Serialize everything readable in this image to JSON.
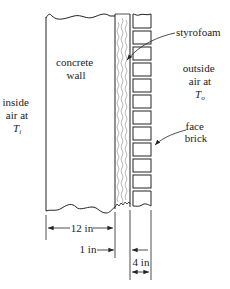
{
  "labels": {
    "concrete_wall": [
      "concrete",
      "wall"
    ],
    "inside_air": [
      "inside",
      "air at"
    ],
    "inside_temp": {
      "symbol": "T",
      "sub": "i"
    },
    "outside_air": [
      "outside",
      "air at"
    ],
    "outside_temp": {
      "symbol": "T",
      "sub": "o"
    },
    "styrofoam": "styrofoam",
    "face_brick": [
      "face",
      "brick"
    ]
  },
  "dimensions": {
    "concrete": "12 in",
    "styrofoam": "1 in",
    "brick": "4 in"
  },
  "colors": {
    "line": "#222222",
    "background": "#ffffff"
  },
  "layers": [
    {
      "name": "concrete wall",
      "thickness": "12 in"
    },
    {
      "name": "styrofoam",
      "thickness": "1 in"
    },
    {
      "name": "face brick",
      "thickness": "4 in"
    }
  ]
}
